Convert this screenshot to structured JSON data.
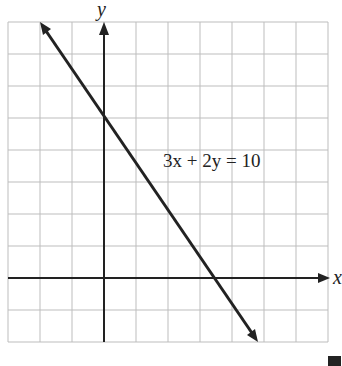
{
  "chart_data": {
    "type": "line",
    "title": "",
    "equation": "3x + 2y = 10",
    "xlabel": "x",
    "ylabel": "y",
    "xlim": [
      -3,
      7
    ],
    "ylim": [
      -2,
      8
    ],
    "grid": true,
    "grid_step": 1,
    "series": [
      {
        "name": "3x + 2y = 10",
        "x": [
          -2,
          4.67
        ],
        "y": [
          8,
          -2
        ]
      }
    ],
    "key_points": [
      {
        "x": 0,
        "y": 5,
        "label": "y-intercept"
      },
      {
        "x": 3.33,
        "y": 0,
        "label": "x-intercept"
      }
    ]
  },
  "labels": {
    "x_axis": "x",
    "y_axis": "y",
    "equation": "3x + 2y = 10"
  }
}
